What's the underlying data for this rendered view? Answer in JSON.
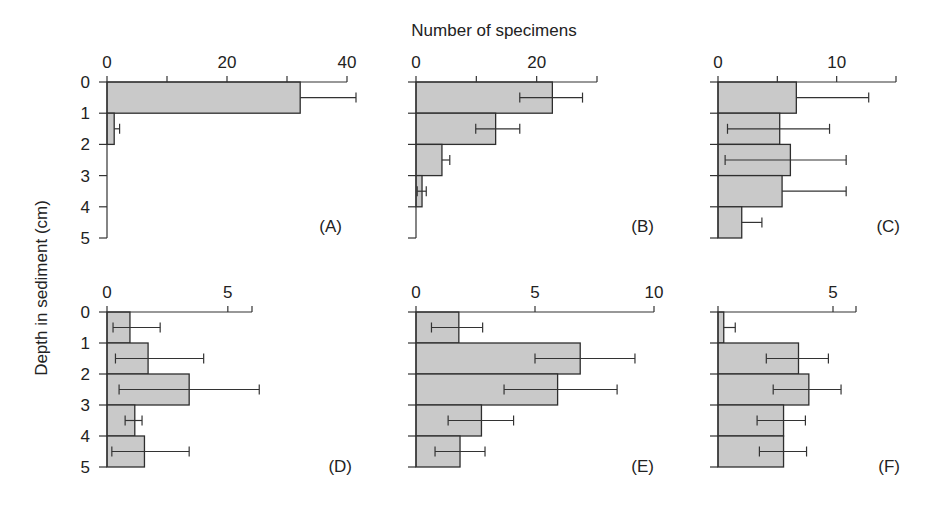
{
  "chart_data": {
    "type": "bar",
    "orientation": "horizontal",
    "title": "",
    "xlabel": "Number of specimens",
    "ylabel": "Depth in sediment (cm)",
    "depth_ticks": [
      "0",
      "1",
      "2",
      "3",
      "4",
      "5"
    ],
    "depth_intervals": [
      "0-1",
      "1-2",
      "2-3",
      "3-4",
      "4-5"
    ],
    "grid": false,
    "colors": {
      "bar_fill": "#c9c9c9",
      "bar_stroke": "#2e2e2e",
      "axis": "#333333"
    },
    "panels": [
      {
        "label": "(A)",
        "xlim": [
          0,
          40
        ],
        "x_ticks": [
          0,
          10,
          20,
          30,
          40
        ],
        "x_tick_labels": [
          "0",
          "20",
          "40"
        ],
        "x_tick_label_values": [
          0,
          20,
          40
        ],
        "values": [
          32.2,
          1.2,
          0,
          0,
          0
        ],
        "error_low": [
          null,
          null,
          null,
          null,
          null
        ],
        "error_high": [
          41.5,
          2.1,
          null,
          null,
          null
        ]
      },
      {
        "label": "(B)",
        "xlim": [
          0,
          30
        ],
        "x_ticks": [
          0,
          10,
          20,
          30
        ],
        "x_tick_labels": [
          "0",
          "20"
        ],
        "x_tick_label_values": [
          0,
          20
        ],
        "values": [
          22.6,
          13.2,
          4.3,
          1.0,
          0
        ],
        "error_low": [
          17.2,
          9.9,
          null,
          0.2,
          null
        ],
        "error_high": [
          27.6,
          17.2,
          5.6,
          1.7,
          null
        ]
      },
      {
        "label": "(C)",
        "xlim": [
          0,
          15
        ],
        "x_ticks": [
          0,
          5,
          10,
          15
        ],
        "x_tick_labels": [
          "0",
          "10"
        ],
        "x_tick_label_values": [
          0,
          10
        ],
        "values": [
          6.6,
          5.2,
          6.1,
          5.4,
          2.0
        ],
        "error_low": [
          null,
          0.8,
          0.6,
          null,
          null
        ],
        "error_high": [
          12.7,
          9.4,
          10.8,
          10.8,
          3.7
        ]
      },
      {
        "label": "(D)",
        "xlim": [
          0,
          6
        ],
        "x_ticks": [
          0,
          5,
          6
        ],
        "x_tick_labels": [
          "0",
          "5"
        ],
        "x_tick_label_values": [
          0,
          5
        ],
        "values": [
          0.95,
          1.7,
          3.4,
          1.15,
          1.55
        ],
        "error_low": [
          0.25,
          0.35,
          0.5,
          0.75,
          0.2
        ],
        "error_high": [
          2.2,
          4.0,
          6.3,
          1.45,
          3.4
        ]
      },
      {
        "label": "(E)",
        "xlim": [
          0,
          10
        ],
        "x_ticks": [
          0,
          5,
          10
        ],
        "x_tick_labels": [
          "0",
          "5",
          "10"
        ],
        "x_tick_label_values": [
          0,
          5,
          10
        ],
        "values": [
          1.8,
          6.9,
          5.95,
          2.75,
          1.85
        ],
        "error_low": [
          0.65,
          5.0,
          3.7,
          1.35,
          0.8
        ],
        "error_high": [
          2.8,
          9.2,
          8.45,
          4.1,
          2.9
        ]
      },
      {
        "label": "(F)",
        "xlim": [
          0,
          6
        ],
        "x_ticks": [
          0,
          5,
          6
        ],
        "x_tick_labels": [
          "5"
        ],
        "x_tick_label_values": [
          5
        ],
        "values": [
          0.25,
          3.5,
          3.95,
          2.85,
          2.85
        ],
        "error_low": [
          null,
          2.1,
          2.4,
          1.7,
          1.8
        ],
        "error_high": [
          0.75,
          4.8,
          5.35,
          3.8,
          3.85
        ]
      }
    ]
  },
  "layout": {
    "panels": [
      {
        "x0": 107,
        "x1": 347,
        "y0": 82,
        "y1": 238,
        "show_depth_labels": true,
        "label_x": 342,
        "label_y": 232
      },
      {
        "x0": 416,
        "x1": 597,
        "y0": 82,
        "y1": 238,
        "show_depth_labels": false,
        "label_x": 654,
        "label_y": 232
      },
      {
        "x0": 718,
        "x1": 896,
        "y0": 82,
        "y1": 238,
        "show_depth_labels": false,
        "label_x": 900,
        "label_y": 232
      },
      {
        "x0": 107,
        "x1": 252,
        "y0": 312,
        "y1": 467,
        "show_depth_labels": true,
        "label_x": 352,
        "label_y": 472
      },
      {
        "x0": 416,
        "x1": 654,
        "y0": 312,
        "y1": 467,
        "show_depth_labels": false,
        "label_x": 654,
        "label_y": 472
      },
      {
        "x0": 718,
        "x1": 856,
        "y0": 312,
        "y1": 467,
        "show_depth_labels": false,
        "label_x": 900,
        "label_y": 472
      }
    ],
    "xlabel_pos": {
      "x": 494,
      "y": 36
    },
    "ylabel_pos": {
      "x": 47,
      "y": 288
    }
  }
}
